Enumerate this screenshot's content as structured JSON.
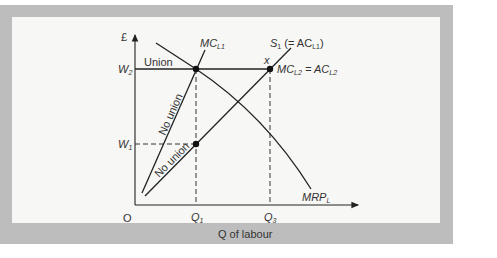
{
  "diagram": {
    "type": "labour-market-union-model",
    "y_axis_label": "£",
    "x_axis_label": "Q of labour",
    "origin_label": "O",
    "y_ticks": [
      {
        "id": "w2",
        "label": "W",
        "sub": "2"
      },
      {
        "id": "w1",
        "label": "W",
        "sub": "1"
      }
    ],
    "x_ticks": [
      {
        "id": "q1",
        "label": "Q",
        "sub": "1"
      },
      {
        "id": "q3",
        "label": "Q",
        "sub": "3"
      }
    ],
    "curves": {
      "mc_l1": {
        "label": "MC",
        "sub": "L1"
      },
      "s1": {
        "label_pre": "S",
        "label_pre_sub": "1",
        "label_mid": " (= AC",
        "label_mid_sub": "L1",
        "label_post": ")"
      },
      "mrp": {
        "label": "MRP",
        "sub": "L"
      },
      "mc_l2": {
        "label_a": "MC",
        "sub_a": "L2",
        "eq": " = AC",
        "sub_b": "L2"
      }
    },
    "annotations": {
      "union": "Union",
      "no_union_upper": "No union",
      "no_union_lower": "No union",
      "point_x": "x"
    },
    "colors": {
      "frame": "#bdbdbd",
      "panel": "#f7f7f5",
      "line": "#222222",
      "text": "#333333"
    }
  }
}
